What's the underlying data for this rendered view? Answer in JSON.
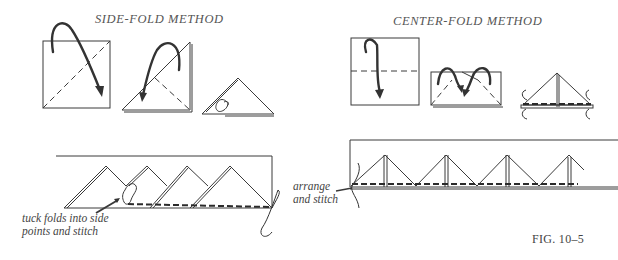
{
  "figure": {
    "caption": "FIG. 10–5",
    "side_fold": {
      "title": "SIDE-FOLD METHOD",
      "steps": [
        "square with diagonal fold",
        "folded triangle",
        "tucked triangle"
      ],
      "annotation": {
        "line1": "tuck folds into side",
        "line2": "points and stitch"
      }
    },
    "center_fold": {
      "title": "CENTER-FOLD METHOD",
      "steps": [
        "square with center fold",
        "rectangle with corner folds",
        "finished prairie point"
      ],
      "annotation": {
        "line1": "arrange",
        "line2": "and stitch"
      }
    }
  }
}
